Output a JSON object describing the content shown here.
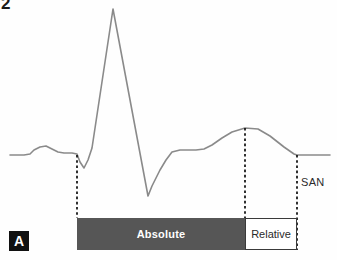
{
  "figure": {
    "corner_mark": "2",
    "panel_label": "A"
  },
  "labels": {
    "absolute": "Absolute",
    "relative": "Relative",
    "san": "SAN"
  },
  "colors": {
    "trace": "#8a8a8a",
    "absolute_bar": "#565656",
    "relative_bar_border": "#3a3a3a",
    "dashed_line": "#1a1a1a",
    "panel_label_bg": "#111111",
    "background": "#ffffff"
  },
  "chart_data": {
    "type": "line",
    "title": "",
    "xlabel": "",
    "ylabel": "",
    "grid": false,
    "legend": "none",
    "xlim": [
      0,
      337
    ],
    "ylim": [
      260,
      0
    ],
    "series": [
      {
        "name": "ECG action potential trace",
        "points": [
          [
            10,
            155
          ],
          [
            24,
            155
          ],
          [
            30,
            154
          ],
          [
            34,
            150
          ],
          [
            40,
            147
          ],
          [
            46,
            146
          ],
          [
            52,
            149
          ],
          [
            58,
            152
          ],
          [
            64,
            153
          ],
          [
            72,
            153
          ],
          [
            77,
            154
          ],
          [
            80,
            162
          ],
          [
            84,
            168
          ],
          [
            88,
            160
          ],
          [
            92,
            148
          ],
          [
            113,
            9
          ],
          [
            148,
            196
          ],
          [
            152,
            186
          ],
          [
            160,
            170
          ],
          [
            166,
            160
          ],
          [
            172,
            152
          ],
          [
            180,
            150
          ],
          [
            196,
            150
          ],
          [
            204,
            149
          ],
          [
            212,
            145
          ],
          [
            222,
            138
          ],
          [
            232,
            132
          ],
          [
            245,
            128
          ],
          [
            258,
            129
          ],
          [
            270,
            136
          ],
          [
            284,
            147
          ],
          [
            294,
            154
          ],
          [
            297,
            155
          ],
          [
            330,
            155
          ]
        ]
      }
    ],
    "markers": [
      {
        "name": "absolute-refractory-start",
        "x": 77,
        "y_top": 155,
        "y_bottom": 218,
        "style": "dashed"
      },
      {
        "name": "absolute-refractory-end",
        "x": 245,
        "y_top": 128,
        "y_bottom": 218,
        "style": "dashed"
      },
      {
        "name": "relative-refractory-end",
        "x": 297,
        "y_top": 155,
        "y_bottom": 250,
        "style": "dashed"
      }
    ],
    "regions": [
      {
        "label": "Absolute",
        "x_start": 77,
        "x_end": 245,
        "fill": "#565656",
        "text_color": "#ffffff"
      },
      {
        "label": "Relative",
        "x_start": 245,
        "x_end": 297,
        "fill": "#ffffff",
        "text_color": "#2a2a2a"
      }
    ],
    "annotations": [
      {
        "text": "SAN",
        "x": 301,
        "y": 182
      },
      {
        "text": "A",
        "x": 19,
        "y": 241
      },
      {
        "text": "2",
        "x": 5,
        "y": 4
      }
    ]
  }
}
